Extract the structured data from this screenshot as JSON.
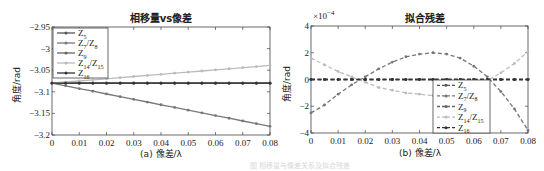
{
  "chart_data": [
    {
      "type": "line",
      "title": "相移量vs像差",
      "xlabel": "(a) 像差/λ",
      "ylabel": "角度/rad",
      "xlim": [
        0,
        0.08
      ],
      "ylim": [
        -3.2,
        -2.95
      ],
      "xticks": [
        "0",
        "0.01",
        "0.02",
        "0.03",
        "0.04",
        "0.05",
        "0.06",
        "0.07",
        "0.08"
      ],
      "yticks": [
        "-2.95",
        "-3",
        "-3.05",
        "-3.1",
        "-3.15",
        "-3.2"
      ],
      "grid": false,
      "legend_position": "upper left",
      "x": [
        0,
        0.005,
        0.01,
        0.015,
        0.02,
        0.025,
        0.03,
        0.035,
        0.04,
        0.045,
        0.05,
        0.055,
        0.06,
        0.065,
        0.07,
        0.075,
        0.08
      ],
      "series": [
        {
          "name": "Z5",
          "label_main": "Z",
          "label_sub": "5",
          "color": "#555555",
          "values": [
            -3.08,
            -3.08,
            -3.08,
            -3.08,
            -3.08,
            -3.08,
            -3.08,
            -3.08,
            -3.08,
            -3.08,
            -3.08,
            -3.08,
            -3.08,
            -3.08,
            -3.08,
            -3.08,
            -3.08
          ]
        },
        {
          "name": "Z7/Z8",
          "label_main": "Z",
          "label_sub": "7",
          "label_main2": "/Z",
          "label_sub2": "8",
          "color": "#777777",
          "values": [
            -3.08,
            -3.0862,
            -3.0925,
            -3.0987,
            -3.105,
            -3.1112,
            -3.1175,
            -3.1237,
            -3.13,
            -3.1362,
            -3.1425,
            -3.1487,
            -3.155,
            -3.1612,
            -3.1675,
            -3.1737,
            -3.18
          ]
        },
        {
          "name": "Z9",
          "label_main": "Z",
          "label_sub": "9",
          "color": "#666666",
          "values": [
            -3.08,
            -3.08,
            -3.08,
            -3.08,
            -3.08,
            -3.08,
            -3.08,
            -3.08,
            -3.08,
            -3.08,
            -3.08,
            -3.08,
            -3.08,
            -3.08,
            -3.08,
            -3.08,
            -3.08
          ]
        },
        {
          "name": "Z14/Z15",
          "label_main": "Z",
          "label_sub": "14",
          "label_main2": "/Z",
          "label_sub2": "15",
          "color": "#bbbbbb",
          "values": [
            -3.08,
            -3.0774,
            -3.0749,
            -3.0723,
            -3.0698,
            -3.0672,
            -3.0646,
            -3.0621,
            -3.0595,
            -3.0569,
            -3.0544,
            -3.0518,
            -3.0493,
            -3.0467,
            -3.0441,
            -3.0416,
            -3.039
          ]
        },
        {
          "name": "Z16",
          "label_main": "Z",
          "label_sub": "16",
          "color": "#333333",
          "values": [
            -3.08,
            -3.08,
            -3.08,
            -3.08,
            -3.08,
            -3.08,
            -3.08,
            -3.08,
            -3.08,
            -3.08,
            -3.08,
            -3.08,
            -3.08,
            -3.08,
            -3.08,
            -3.08,
            -3.08
          ]
        }
      ]
    },
    {
      "type": "line",
      "title": "拟合残差",
      "xlabel": "(b) 像差/λ",
      "ylabel": "角度/rad",
      "y_multiplier": "×10^-4",
      "y_multiplier_base": "×10",
      "y_multiplier_exp": "−4",
      "xlim": [
        0,
        0.08
      ],
      "ylim": [
        -4,
        4
      ],
      "xticks": [
        "0",
        "0.01",
        "0.02",
        "0.03",
        "0.04",
        "0.05",
        "0.06",
        "0.07",
        "0.08"
      ],
      "yticks": [
        "4",
        "2",
        "0",
        "-2",
        "-4"
      ],
      "grid": false,
      "legend_position": "lower right",
      "line_style": "dashed",
      "x": [
        0,
        0.005,
        0.01,
        0.015,
        0.02,
        0.025,
        0.03,
        0.035,
        0.04,
        0.045,
        0.05,
        0.055,
        0.06,
        0.065,
        0.07,
        0.075,
        0.08
      ],
      "series": [
        {
          "name": "Z5",
          "label_main": "Z",
          "label_sub": "5",
          "color": "#555555",
          "values": [
            0,
            0,
            0,
            0,
            0,
            0,
            0,
            0,
            0,
            0,
            0,
            0,
            0,
            0,
            0,
            0,
            0
          ]
        },
        {
          "name": "Z7/Z8",
          "label_main": "Z",
          "label_sub": "7",
          "label_main2": "/Z",
          "label_sub2": "8",
          "color": "#777777",
          "values": [
            -2.5,
            -1.9,
            -1.1,
            -0.4,
            0.2,
            0.8,
            1.3,
            1.7,
            1.9,
            2.0,
            1.9,
            1.6,
            1.0,
            0.2,
            -0.9,
            -2.2,
            -3.8
          ]
        },
        {
          "name": "Z9",
          "label_main": "Z",
          "label_sub": "9",
          "color": "#666666",
          "values": [
            0,
            0,
            0,
            0,
            0,
            0,
            0,
            0,
            0,
            0,
            0,
            0,
            0,
            0,
            0,
            0,
            0
          ]
        },
        {
          "name": "Z14/Z15",
          "label_main": "Z",
          "label_sub": "14",
          "label_main2": "/Z",
          "label_sub2": "15",
          "color": "#bbbbbb",
          "values": [
            1.6,
            1.1,
            0.6,
            0.2,
            -0.2,
            -0.6,
            -0.8,
            -1.0,
            -1.1,
            -1.2,
            -1.1,
            -0.9,
            -0.6,
            -0.1,
            0.5,
            1.2,
            2.1
          ]
        },
        {
          "name": "Z16",
          "label_main": "Z",
          "label_sub": "16",
          "color": "#333333",
          "values": [
            0,
            0,
            0,
            0,
            0,
            0,
            0,
            0,
            0,
            0,
            0,
            0,
            0,
            0,
            0,
            0,
            0
          ]
        }
      ]
    }
  ],
  "figure": {
    "left_title": "相移量vs像差",
    "right_title": "拟合残差",
    "left_xlabel": "(a) 像差/λ",
    "right_xlabel": "(b) 像差/λ",
    "ylabel": "角度/rad",
    "multiplier_base": "×10",
    "multiplier_exp": "−4",
    "faint_caption": "图 相移量与像差关系及拟合残差"
  }
}
